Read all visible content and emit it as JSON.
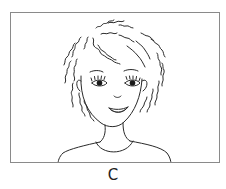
{
  "figure": {
    "caption": "C",
    "colors": {
      "line": "#2a2a2a",
      "frame": "#8a8a8a",
      "background": "#ffffff"
    }
  }
}
